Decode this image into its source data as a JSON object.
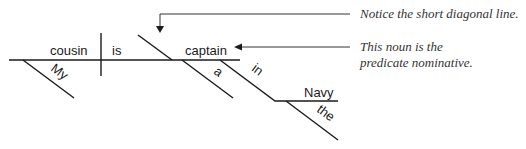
{
  "diagram": {
    "type": "sentence-diagram",
    "sentence_words": {
      "subject": "cousin",
      "verb": "is",
      "predicate_nominative": "captain",
      "subject_modifier": "My",
      "pn_modifier": "a",
      "preposition": "in",
      "object_of_preposition": "Navy",
      "object_modifier": "the"
    },
    "annotations": [
      {
        "id": "diagonal-note",
        "lines": [
          "Notice the short diagonal line."
        ]
      },
      {
        "id": "pn-note",
        "lines": [
          "This noun is the",
          "predicate nominative."
        ]
      }
    ],
    "colors": {
      "line": "#1a1a1a",
      "text": "#1a1a1a",
      "note": "#333333"
    }
  }
}
